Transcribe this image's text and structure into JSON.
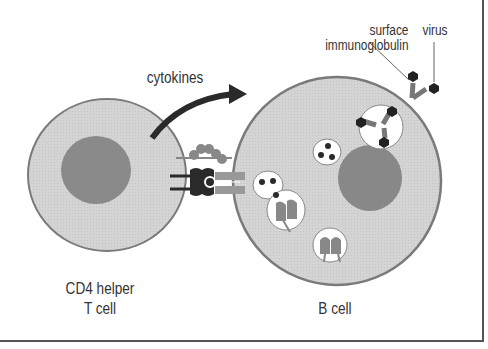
{
  "diagram": {
    "labels": {
      "cytokines": "cytokines",
      "surface_ig_line1": "surface",
      "surface_ig_line2": "immunoglobulin",
      "virus": "virus",
      "t_cell_line1": "CD4 helper",
      "t_cell_line2": "T cell",
      "b_cell": "B cell"
    },
    "nodes": [
      {
        "id": "t-cell",
        "label": "CD4 helper T cell",
        "type": "cell"
      },
      {
        "id": "b-cell",
        "label": "B cell",
        "type": "cell"
      },
      {
        "id": "virus",
        "label": "virus",
        "type": "particle"
      },
      {
        "id": "surface-ig",
        "label": "surface immunoglobulin",
        "type": "receptor"
      }
    ],
    "edges": [
      {
        "from": "t-cell",
        "to": "b-cell",
        "label": "cytokines",
        "style": "curved-arrow"
      }
    ],
    "colors": {
      "cell_fill": "#d6d6d6",
      "cell_border": "#7a7a7a",
      "nucleus": "#8a8a8a",
      "dark": "#2a2a2a",
      "receptor": "#9a9a9a",
      "frame": "#555555"
    }
  }
}
